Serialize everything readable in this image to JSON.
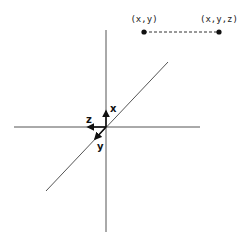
{
  "diagram": {
    "type": "coordinate-axes-projection",
    "axes": {
      "x_label": "x",
      "y_label": "y",
      "z_label": "z"
    },
    "projection": {
      "point_2d_label": "(x,y)",
      "point_3d_label": "(x,y,z)",
      "connector_style": "dashed"
    },
    "colors": {
      "line": "#555555",
      "arrow": "#111111",
      "background": "#ffffff"
    }
  }
}
